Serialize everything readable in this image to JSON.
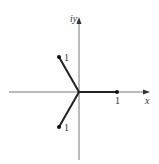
{
  "diagram": {
    "axes": {
      "x_label": "x",
      "y_label": "iy",
      "color": "#666666"
    },
    "origin": {
      "x": 79,
      "y": 92
    },
    "vectors": [
      {
        "name": "vector-real",
        "end": {
          "x": 117,
          "y": 92
        },
        "label": "1"
      },
      {
        "name": "vector-upper-left",
        "end": {
          "x": 59,
          "y": 57
        },
        "label": "1"
      },
      {
        "name": "vector-lower-left",
        "end": {
          "x": 59,
          "y": 127
        },
        "label": "1"
      }
    ],
    "tick_label": "1",
    "line_color": "#222222"
  }
}
